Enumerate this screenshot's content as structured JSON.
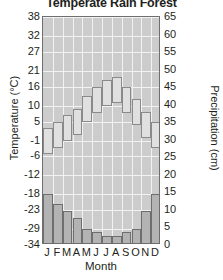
{
  "chart_data": {
    "type": "bar",
    "title": "Temperate Rain Forest",
    "xlabel": "Month",
    "ylabel": "Temperature (°C)",
    "y2label": "Precipitation (cm)",
    "categories": [
      "J",
      "F",
      "M",
      "A",
      "M",
      "J",
      "J",
      "A",
      "S",
      "O",
      "N",
      "D"
    ],
    "grid": true,
    "legend": "none",
    "ylim": [
      -34,
      38
    ],
    "y2lim": [
      0,
      65
    ],
    "yticks": [
      38,
      32,
      27,
      21,
      16,
      10,
      5,
      -1,
      -6,
      -12,
      -18,
      -23,
      -29,
      -34
    ],
    "y2ticks": [
      65,
      60,
      55,
      50,
      45,
      40,
      35,
      30,
      25,
      20,
      15,
      10,
      5,
      0
    ],
    "series": [
      {
        "name": "Temperature (°C)",
        "axis": "left",
        "style": "step-bar",
        "values": [
          3,
          5,
          7,
          9,
          13,
          16,
          18,
          19,
          16,
          12,
          8,
          5
        ]
      },
      {
        "name": "Precipitation (cm)",
        "axis": "right",
        "style": "bar",
        "values": [
          14,
          11,
          9,
          7,
          4,
          3,
          2,
          2,
          3,
          4,
          9,
          14
        ]
      }
    ]
  },
  "chart": {
    "title": "Temperate Rain Forest",
    "left_axis_label": "Temperature (°C)",
    "right_axis_label": "Precipitation (cm)",
    "bottom_axis_label": "Month",
    "left_ticks": [
      "38",
      "32",
      "27",
      "21",
      "16",
      "10",
      "5",
      "-1",
      "-6",
      "-12",
      "-18",
      "-23",
      "-29",
      "-34"
    ],
    "right_ticks": [
      "65",
      "60",
      "55",
      "50",
      "45",
      "40",
      "35",
      "30",
      "25",
      "20",
      "15",
      "10",
      "5",
      "0"
    ],
    "month_ticks": [
      "J",
      "F",
      "M",
      "A",
      "M",
      "J",
      "J",
      "A",
      "S",
      "O",
      "N",
      "D"
    ],
    "colors": {
      "plot_background": "#cccccc",
      "gridline": "#f2f2f2",
      "frame": "#6e6e6e",
      "precip_bar_fill": "#b3b3b3",
      "precip_bar_stroke": "#6e6e6e",
      "temp_bar_fill": "#e0e0e0",
      "temp_bar_stroke": "#8a8a8a",
      "text": "#231f20"
    }
  }
}
